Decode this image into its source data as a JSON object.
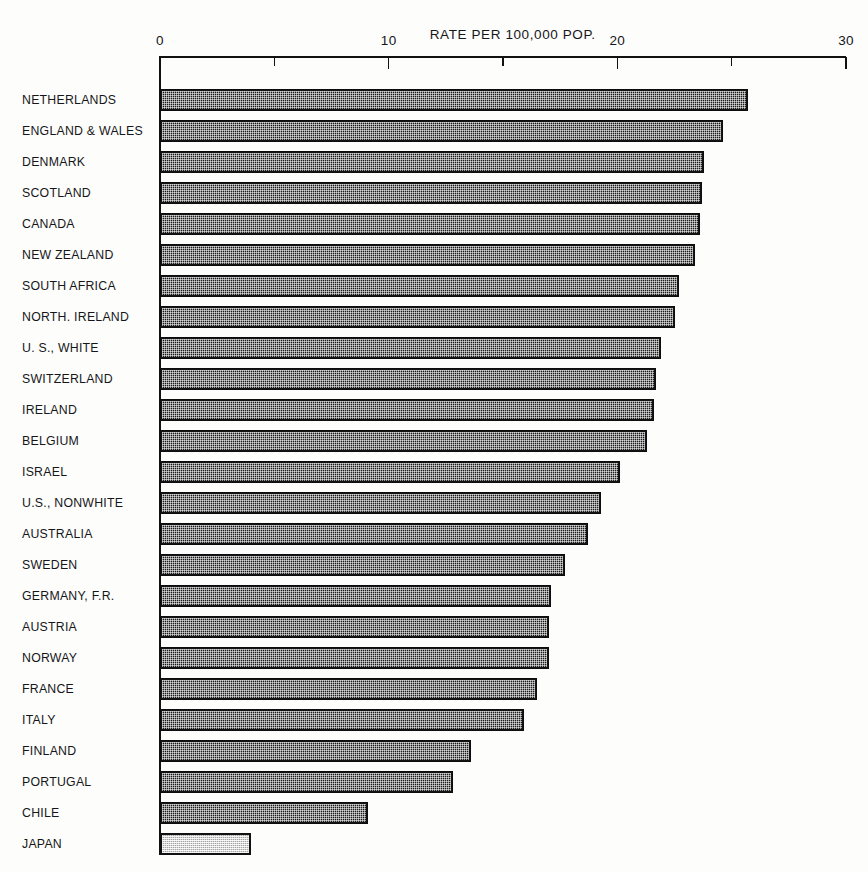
{
  "chart_data": {
    "type": "bar",
    "orientation": "horizontal",
    "title": "RATE PER 100,000 POP.",
    "xlabel": "RATE PER 100,000 POP.",
    "ylabel": "",
    "xlim": [
      0,
      30
    ],
    "grid": false,
    "legend": null,
    "x_major_ticks": [
      "0",
      "10",
      "20",
      "30"
    ],
    "x_major_values": [
      0,
      10,
      20,
      30
    ],
    "x_minor_values": [
      5,
      15,
      25
    ],
    "categories": [
      "NETHERLANDS",
      "ENGLAND & WALES",
      "DENMARK",
      "SCOTLAND",
      "CANADA",
      "NEW ZEALAND",
      "SOUTH AFRICA",
      "NORTH. IRELAND",
      "U. S., WHITE",
      "SWITZERLAND",
      "IRELAND",
      "BELGIUM",
      "ISRAEL",
      "U.S., NONWHITE",
      "AUSTRALIA",
      "SWEDEN",
      "GERMANY, F.R.",
      "AUSTRIA",
      "NORWAY",
      "FRANCE",
      "ITALY",
      "FINLAND",
      "PORTUGAL",
      "CHILE",
      "JAPAN"
    ],
    "values": [
      25.7,
      24.6,
      23.8,
      23.7,
      23.6,
      23.4,
      22.7,
      22.5,
      21.9,
      21.7,
      21.6,
      21.3,
      20.1,
      19.3,
      18.7,
      17.7,
      17.1,
      17.0,
      17.0,
      16.5,
      15.9,
      13.6,
      12.8,
      9.1,
      4.0
    ],
    "highlight_category": "JAPAN",
    "series_style": {
      "bar_fill": "#1b1b1b",
      "bar_pattern": "halftone-stipple",
      "highlight_fill": "#dadada",
      "outline": "#0d0d0d"
    }
  },
  "axis": {
    "ticks": [
      {
        "label": "0",
        "value": 0
      },
      {
        "label": "10",
        "value": 10
      },
      {
        "label": "20",
        "value": 20
      },
      {
        "label": "30",
        "value": 30
      }
    ]
  }
}
